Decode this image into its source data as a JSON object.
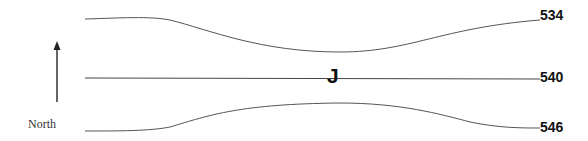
{
  "diagram": {
    "contours": [
      {
        "label": "534",
        "path": "M85,19 C120,18 150,16 170,20 C210,30 260,52 340,52 C410,52 440,28 540,20"
      },
      {
        "label": "540",
        "path": "M85,78 L540,79"
      },
      {
        "label": "546",
        "path": "M85,131 C120,131 150,131 170,127 C210,115 240,104 340,103 C400,103 440,114 470,122 C500,128 520,128 540,128"
      }
    ],
    "center_label": "J",
    "north_label": "North",
    "line_color": "#555555"
  }
}
